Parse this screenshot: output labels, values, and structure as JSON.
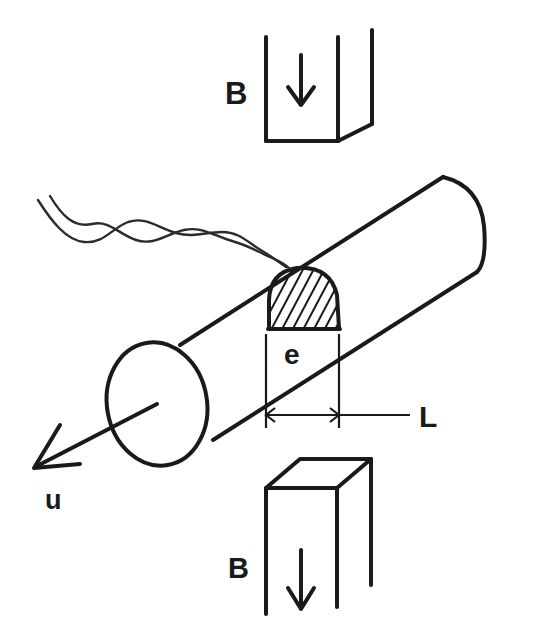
{
  "figure": {
    "background_color": "#ffffff",
    "ink_color": "#1a1a1a",
    "width": 536,
    "height": 624
  },
  "labels": {
    "field_top": "B",
    "field_bottom": "B",
    "thickness": "e",
    "length": "L",
    "velocity": "u"
  },
  "annotations": {
    "top_box": {
      "label": "B",
      "arrow_direction": "down",
      "shape": "open-rectangular-prism"
    },
    "bottom_box": {
      "label": "B",
      "arrow_direction": "down",
      "shape": "open-rectangular-prism"
    },
    "cylinder": {
      "axis_label": "u",
      "axis_direction": "down-left",
      "segment_label": "e",
      "span_label": "L",
      "segment_fill": "diagonal-hatch"
    },
    "wave": {
      "description": "twisted double sine wave incident on cylinder",
      "cycles": 3
    }
  }
}
